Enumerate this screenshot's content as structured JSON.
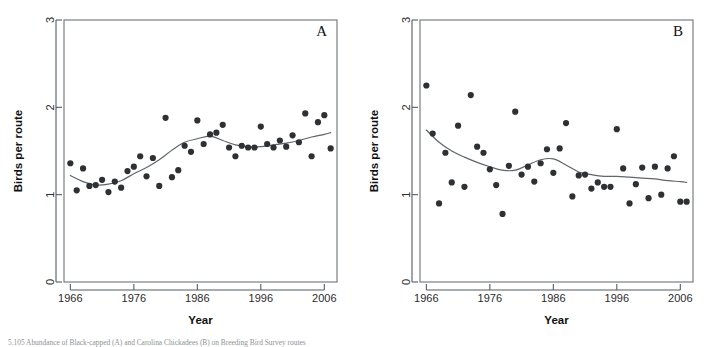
{
  "figure": {
    "caption": "5.105   Abundance of Black-capped (A) and Carolina Chickadees (B) on Breeding Bird Survey routes",
    "background": "#ffffff",
    "point_color": "#2e3134",
    "line_color": "#5f6569",
    "axis_color": "#555b60"
  },
  "chart_data": [
    {
      "type": "scatter",
      "panel_label": "A",
      "title": "",
      "xlabel": "Year",
      "ylabel": "Birds per route",
      "xlim": [
        1965,
        2008
      ],
      "ylim": [
        0,
        3
      ],
      "xticks": [
        1966,
        1976,
        1986,
        1996,
        2006
      ],
      "yticks": [
        0,
        1,
        2,
        3
      ],
      "grid": false,
      "legend": "none",
      "series": [
        {
          "name": "Black-capped Chickadee",
          "x": [
            1966,
            1967,
            1968,
            1969,
            1970,
            1971,
            1972,
            1973,
            1974,
            1975,
            1976,
            1977,
            1978,
            1979,
            1980,
            1981,
            1982,
            1983,
            1984,
            1985,
            1986,
            1987,
            1988,
            1989,
            1990,
            1991,
            1992,
            1993,
            1994,
            1995,
            1996,
            1997,
            1998,
            1999,
            2000,
            2001,
            2002,
            2003,
            2004,
            2005,
            2006,
            2007
          ],
          "y": [
            1.36,
            1.05,
            1.3,
            1.1,
            1.11,
            1.17,
            1.03,
            1.15,
            1.08,
            1.27,
            1.32,
            1.44,
            1.21,
            1.42,
            1.1,
            1.88,
            1.2,
            1.28,
            1.56,
            1.49,
            1.85,
            1.58,
            1.69,
            1.71,
            1.8,
            1.54,
            1.44,
            1.56,
            1.54,
            1.54,
            1.78,
            1.58,
            1.54,
            1.62,
            1.55,
            1.68,
            1.6,
            1.93,
            1.44,
            1.83,
            1.91,
            1.53
          ]
        }
      ],
      "trend_line": {
        "name": "loess smoother",
        "x": [
          1966,
          1968,
          1970,
          1972,
          1974,
          1976,
          1978,
          1980,
          1982,
          1984,
          1986,
          1988,
          1990,
          1992,
          1994,
          1996,
          1998,
          2000,
          2002,
          2004,
          2006,
          2007
        ],
        "y": [
          1.22,
          1.15,
          1.11,
          1.12,
          1.16,
          1.24,
          1.31,
          1.4,
          1.51,
          1.6,
          1.64,
          1.67,
          1.62,
          1.57,
          1.55,
          1.55,
          1.57,
          1.59,
          1.62,
          1.66,
          1.69,
          1.71
        ]
      }
    },
    {
      "type": "scatter",
      "panel_label": "B",
      "title": "",
      "xlabel": "Year",
      "ylabel": "Birds per route",
      "xlim": [
        1965,
        2008
      ],
      "ylim": [
        0,
        3
      ],
      "xticks": [
        1966,
        1976,
        1986,
        1996,
        2006
      ],
      "yticks": [
        0,
        1,
        2,
        3
      ],
      "grid": false,
      "legend": "none",
      "series": [
        {
          "name": "Carolina Chickadee",
          "x": [
            1966,
            1967,
            1968,
            1969,
            1970,
            1971,
            1972,
            1973,
            1974,
            1975,
            1976,
            1977,
            1978,
            1979,
            1980,
            1981,
            1982,
            1983,
            1984,
            1985,
            1986,
            1987,
            1988,
            1989,
            1990,
            1991,
            1992,
            1993,
            1994,
            1995,
            1996,
            1997,
            1998,
            1999,
            2000,
            2001,
            2002,
            2003,
            2004,
            2005,
            2006,
            2007
          ],
          "y": [
            2.25,
            1.7,
            0.9,
            1.48,
            1.14,
            1.79,
            1.09,
            2.14,
            1.55,
            1.48,
            1.29,
            1.11,
            0.78,
            1.33,
            1.95,
            1.23,
            1.32,
            1.15,
            1.36,
            1.52,
            1.25,
            1.53,
            1.82,
            0.98,
            1.22,
            1.23,
            1.07,
            1.14,
            1.09,
            1.09,
            1.75,
            1.3,
            0.9,
            1.12,
            1.31,
            0.96,
            1.32,
            1.0,
            1.3,
            1.44,
            0.92,
            0.92
          ]
        }
      ],
      "trend_line": {
        "name": "loess smoother",
        "x": [
          1966,
          1968,
          1970,
          1972,
          1974,
          1976,
          1978,
          1980,
          1982,
          1984,
          1986,
          1988,
          1990,
          1992,
          1994,
          1996,
          1998,
          2000,
          2002,
          2004,
          2006,
          2007
        ],
        "y": [
          1.74,
          1.6,
          1.5,
          1.43,
          1.37,
          1.32,
          1.28,
          1.28,
          1.34,
          1.4,
          1.41,
          1.34,
          1.26,
          1.23,
          1.21,
          1.21,
          1.2,
          1.19,
          1.18,
          1.16,
          1.15,
          1.14
        ]
      }
    }
  ]
}
